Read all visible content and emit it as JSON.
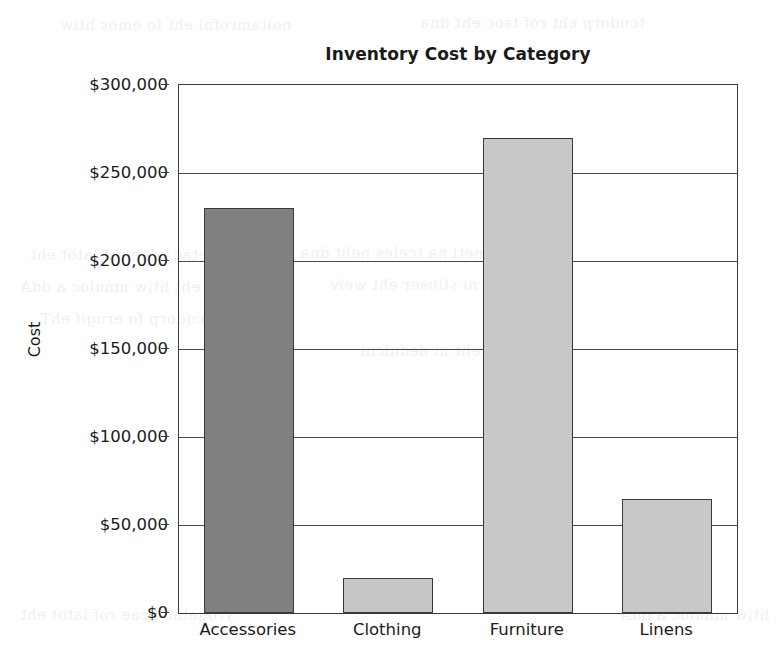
{
  "chart_data": {
    "type": "bar",
    "title": "Inventory Cost by Category",
    "xlabel": "",
    "ylabel": "Cost",
    "categories": [
      "Accessories",
      "Clothing",
      "Furniture",
      "Linens"
    ],
    "values": [
      230000,
      20000,
      270000,
      65000
    ],
    "series": [
      {
        "name": "Cost",
        "values": [
          230000,
          20000,
          270000,
          65000
        ]
      }
    ],
    "ylim": [
      0,
      300000
    ],
    "ytick_values": [
      0,
      50000,
      100000,
      150000,
      200000,
      250000,
      300000
    ],
    "ytick_labels": [
      "$0",
      "$50,000",
      "$100,000",
      "$150,000",
      "$200,000",
      "$250,000",
      "$300,000"
    ],
    "grid": true,
    "grid_axis": "y",
    "legend": false,
    "legend_position": "none",
    "bar_colors": [
      "#808080",
      "#c6c6c6",
      "#c9c9c9",
      "#c8c8c8"
    ],
    "bar_edge_color": "#3a3a3a",
    "plot_border_color": "#3a3a3a",
    "background_color": "#ffffff",
    "bars": [
      {
        "category": "Accessories",
        "value": 230000,
        "value_label": "$230,000",
        "color": "#808080"
      },
      {
        "category": "Clothing",
        "value": 20000,
        "value_label": "$20,000",
        "color": "#c6c6c6"
      },
      {
        "category": "Furniture",
        "value": 270000,
        "value_label": "$270,000",
        "color": "#c9c9c9"
      },
      {
        "category": "Linens",
        "value": 65000,
        "value_label": "$65,000",
        "color": "#c8c8c8"
      }
    ]
  },
  "page_bleed": {
    "lines": [
      "noitamrofni eht fo emos htiw",
      "tcudorp eht rof tsoc eht dna",
      "yrogetac hcae rof latot eht",
      "morf meti na tceles neht dna",
      "eht htiw nmuloc a ddA",
      "elbat eht ni stluser eht weiv",
      "noitcudorp fo erugif ehT",
      "yrammus eht ni dedulcni"
    ]
  }
}
